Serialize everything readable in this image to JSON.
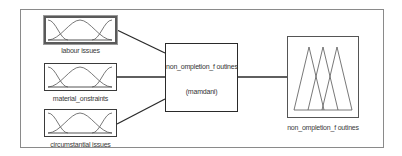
{
  "diagram": {
    "type": "fuzzy-inference-system",
    "inputs": [
      {
        "name": "labour issues",
        "label": "labour issues",
        "selected": true,
        "mf_shape": "gaussian",
        "mf_count": 3
      },
      {
        "name": "material constraints",
        "label": "material_onstraints",
        "selected": false,
        "mf_shape": "gaussian",
        "mf_count": 3
      },
      {
        "name": "circumstantial issues",
        "label": "circumstantial issues",
        "selected": false,
        "mf_shape": "gaussian",
        "mf_count": 3
      }
    ],
    "system": {
      "title": "non_ompletion_f outines",
      "method": "(mamdani)"
    },
    "output": {
      "name": "non completion of outines",
      "label": "non_ompletion_f outines",
      "mf_shape": "triangular",
      "mf_count": 3
    },
    "colors": {
      "frame": "#8a8a8a",
      "box_border": "#3a3a3a",
      "connector": "#2a2a2a",
      "curve": "#555555",
      "background": "#ffffff"
    }
  }
}
